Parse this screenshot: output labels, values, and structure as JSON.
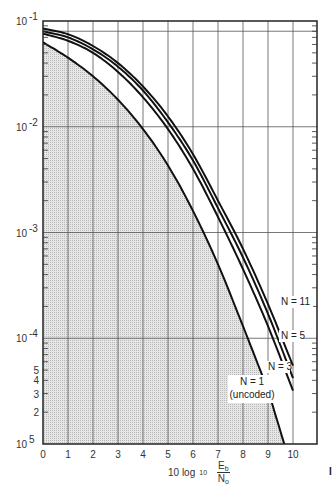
{
  "chart_data": {
    "type": "line",
    "title": "",
    "xlabel": "10 log10 (Eb/No)",
    "xlabel_parts": {
      "prefix": "10 log",
      "subscript": "10",
      "num": "E",
      "num_sub": "b",
      "den": "N",
      "den_sub": "o"
    },
    "ylabel": "",
    "xlim": [
      0,
      11
    ],
    "ylim": [
      1e-05,
      0.1
    ],
    "yscale": "log",
    "grid": true,
    "x_ticks": [
      "0",
      "1",
      "2",
      "3",
      "4",
      "5",
      "6",
      "7",
      "8",
      "9",
      "10"
    ],
    "y_decade_labels": [
      {
        "mantissa": "10",
        "exp": "-1",
        "value": 0.1
      },
      {
        "mantissa": "10",
        "exp": "-2",
        "value": 0.01
      },
      {
        "mantissa": "10",
        "exp": "-3",
        "value": 0.001
      },
      {
        "mantissa": "10",
        "exp": "-4",
        "value": 0.0001
      },
      {
        "mantissa": "10",
        "exp": "5",
        "value": 1e-05
      }
    ],
    "y_minor_labels": [
      {
        "label": "5",
        "value": 5e-05
      },
      {
        "label": "4",
        "value": 4e-05
      },
      {
        "label": "3",
        "value": 3e-05
      },
      {
        "label": "2",
        "value": 2e-05
      }
    ],
    "shaded_region": "area under N = 1 (uncoded) curve",
    "series": [
      {
        "name": "N = 11",
        "label": "N = 11",
        "x": [
          0,
          1,
          2,
          3,
          4,
          5,
          6,
          7,
          8,
          9,
          10
        ],
        "values": [
          0.085,
          0.075,
          0.058,
          0.04,
          0.024,
          0.0125,
          0.0055,
          0.002,
          0.0007,
          0.00021,
          5.5e-05
        ]
      },
      {
        "name": "N = 5",
        "label": "N = 5",
        "x": [
          0,
          1,
          2,
          3,
          4,
          5,
          6,
          7,
          8,
          9,
          10
        ],
        "values": [
          0.08,
          0.07,
          0.054,
          0.037,
          0.022,
          0.011,
          0.0048,
          0.0017,
          0.00058,
          0.00017,
          4.2e-05
        ]
      },
      {
        "name": "N = 3",
        "label": "N = 3",
        "x": [
          0,
          1,
          2,
          3,
          4,
          5,
          6,
          7,
          8,
          9,
          10
        ],
        "values": [
          0.076,
          0.065,
          0.05,
          0.033,
          0.019,
          0.0095,
          0.004,
          0.0014,
          0.00045,
          0.00013,
          3.2e-05
        ]
      },
      {
        "name": "N = 1 (uncoded)",
        "label": "N = 1",
        "label2": "(uncoded)",
        "x": [
          0,
          1,
          2,
          3,
          4,
          5,
          6,
          7,
          8,
          9,
          9.65
        ],
        "values": [
          0.063,
          0.045,
          0.03,
          0.018,
          0.0095,
          0.0043,
          0.0016,
          0.0005,
          0.00013,
          3.3e-05,
          1e-05
        ]
      }
    ]
  },
  "edge_text": "I"
}
